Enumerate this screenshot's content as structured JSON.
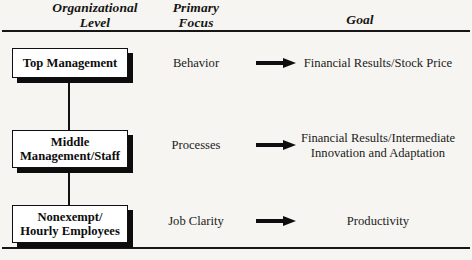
{
  "headers": {
    "organizational_level": {
      "line1": "Organizational",
      "line2": "Level"
    },
    "primary_focus": {
      "line1": "Primary",
      "line2": "Focus"
    },
    "goal": "Goal"
  },
  "rows": [
    {
      "level": {
        "line1": "Top Management",
        "line2": ""
      },
      "focus": "Behavior",
      "goal": {
        "line1": "Financial Results/Stock Price",
        "line2": ""
      },
      "arrow": "arrow-right-icon"
    },
    {
      "level": {
        "line1": "Middle",
        "line2": "Management/Staff"
      },
      "focus": "Processes",
      "goal": {
        "line1": "Financial Results/Intermediate",
        "line2": "Innovation and Adaptation"
      },
      "arrow": "arrow-right-icon"
    },
    {
      "level": {
        "line1": "Nonexempt/",
        "line2": "Hourly Employees"
      },
      "focus": "Job Clarity",
      "goal": {
        "line1": "Productivity",
        "line2": ""
      },
      "arrow": "arrow-right-icon"
    }
  ],
  "colors": {
    "background": "#f6f5f1",
    "ink": "#101010",
    "box_fill": "#ffffff",
    "shadow": "#0d0d0d"
  }
}
